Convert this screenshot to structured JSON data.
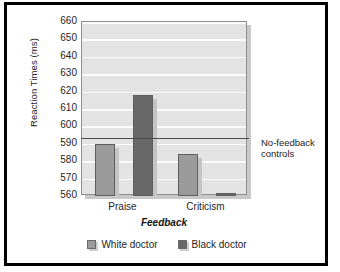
{
  "figure": {
    "border_color": "#000000",
    "background": "#ffffff"
  },
  "chart_data": {
    "type": "bar",
    "title": "",
    "xlabel": "Feedback",
    "ylabel": "Reaction Times (ms)",
    "categories": [
      "Praise",
      "Criticism"
    ],
    "series": [
      {
        "name": "White doctor",
        "color": "#9b9b9b",
        "values": [
          590,
          584
        ]
      },
      {
        "name": "Black doctor",
        "color": "#676767",
        "values": [
          618,
          562
        ]
      }
    ],
    "ylim": [
      560,
      660
    ],
    "yticks": [
      660,
      650,
      640,
      630,
      620,
      610,
      600,
      590,
      580,
      570,
      560
    ],
    "ytick_labels": [
      "660",
      "650",
      "640",
      "630",
      "620",
      "610",
      "600",
      "590",
      "580",
      "570",
      "560"
    ],
    "grid": true,
    "grid_orientation": "horizontal",
    "grid_color": "#fbfbfb",
    "plot_background": "#e3e3e3",
    "legend_position": "bottom",
    "annotations": [
      {
        "name": "no-feedback-controls",
        "label_line1": "No-feedback",
        "label_line2": "controls",
        "type": "horizontal-reference-line",
        "value": 593,
        "color": "#4a4a4a"
      }
    ]
  },
  "axis": {
    "y_title": "Reaction Times (ms)",
    "x_title": "Feedback"
  },
  "legend": {
    "entries": [
      {
        "label": "White doctor",
        "swatch": "legend-swatch-white-doctor"
      },
      {
        "label": "Black doctor",
        "swatch": "legend-swatch-black-doctor"
      }
    ]
  }
}
